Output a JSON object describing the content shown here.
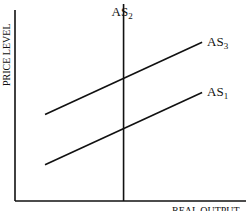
{
  "chart_data": {
    "type": "line",
    "title": "",
    "xlabel": "REAL OUTPUT",
    "ylabel": "PRICE LEVEL",
    "xlim": [
      0,
      10
    ],
    "ylim": [
      0,
      10
    ],
    "grid": false,
    "series": [
      {
        "name": "AS",
        "sub": "1",
        "x": [
          1.3,
          8.1
        ],
        "y": [
          1.8,
          5.4
        ]
      },
      {
        "name": "AS",
        "sub": "2",
        "x": [
          4.7,
          4.7
        ],
        "y": [
          0,
          9.8
        ]
      },
      {
        "name": "AS",
        "sub": "3",
        "x": [
          1.3,
          8.1
        ],
        "y": [
          4.3,
          7.9
        ]
      }
    ]
  }
}
